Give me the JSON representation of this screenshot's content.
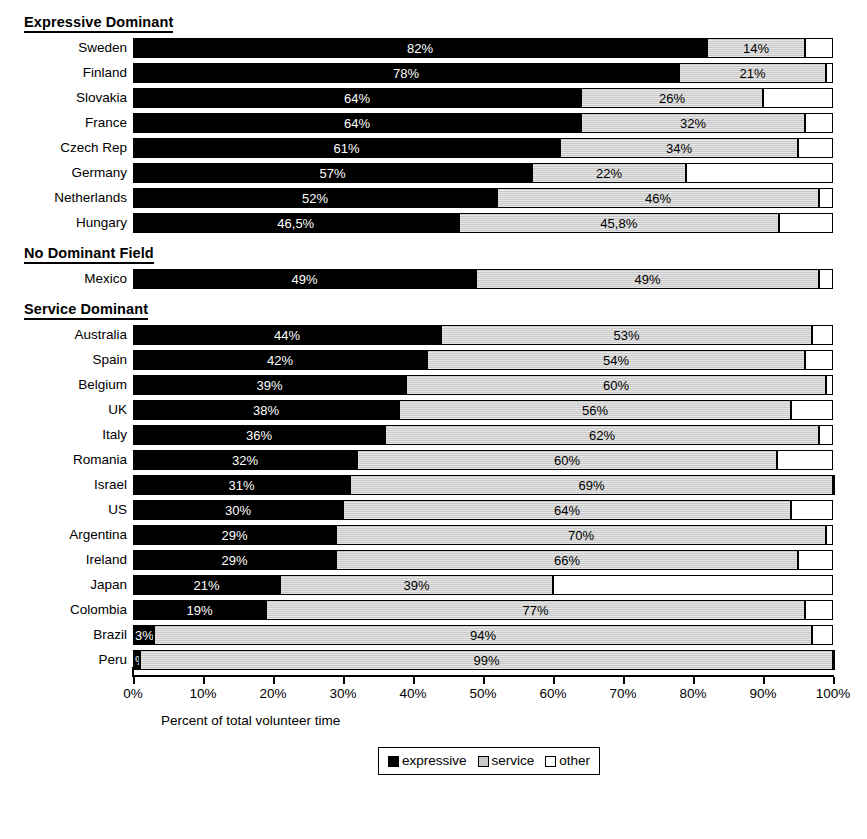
{
  "chart_data": {
    "type": "bar",
    "subtype": "stacked-horizontal-100",
    "title": "",
    "xlabel": "Percent of total volunteer time",
    "ylabel": "",
    "xlim": [
      0,
      100
    ],
    "xticks": [
      "0%",
      "10%",
      "20%",
      "30%",
      "40%",
      "50%",
      "60%",
      "70%",
      "80%",
      "90%",
      "100%"
    ],
    "grid": false,
    "legend_position": "bottom-center",
    "series": [
      {
        "name": "expressive",
        "color": "#000000"
      },
      {
        "name": "service",
        "color": "#c9c9c9"
      },
      {
        "name": "other",
        "color": "#ffffff"
      }
    ],
    "groups": [
      {
        "label": "Expressive Dominant",
        "rows": [
          {
            "category": "Sweden",
            "expressive": 82,
            "service": 14,
            "other": 4,
            "labels": {
              "expressive": "82%",
              "service": "14%",
              "other": ""
            }
          },
          {
            "category": "Finland",
            "expressive": 78,
            "service": 21,
            "other": 1,
            "labels": {
              "expressive": "78%",
              "service": "21%",
              "other": ""
            }
          },
          {
            "category": "Slovakia",
            "expressive": 64,
            "service": 26,
            "other": 10,
            "labels": {
              "expressive": "64%",
              "service": "26%",
              "other": ""
            }
          },
          {
            "category": "France",
            "expressive": 64,
            "service": 32,
            "other": 4,
            "labels": {
              "expressive": "64%",
              "service": "32%",
              "other": ""
            }
          },
          {
            "category": "Czech Rep",
            "expressive": 61,
            "service": 34,
            "other": 5,
            "labels": {
              "expressive": "61%",
              "service": "34%",
              "other": ""
            }
          },
          {
            "category": "Germany",
            "expressive": 57,
            "service": 22,
            "other": 21,
            "labels": {
              "expressive": "57%",
              "service": "22%",
              "other": ""
            }
          },
          {
            "category": "Netherlands",
            "expressive": 52,
            "service": 46,
            "other": 2,
            "labels": {
              "expressive": "52%",
              "service": "46%",
              "other": ""
            }
          },
          {
            "category": "Hungary",
            "expressive": 46.5,
            "service": 45.8,
            "other": 7.7,
            "labels": {
              "expressive": "46,5%",
              "service": "45,8%",
              "other": ""
            }
          }
        ]
      },
      {
        "label": "No Dominant Field",
        "rows": [
          {
            "category": "Mexico",
            "expressive": 49,
            "service": 49,
            "other": 2,
            "labels": {
              "expressive": "49%",
              "service": "49%",
              "other": ""
            }
          }
        ]
      },
      {
        "label": "Service Dominant",
        "rows": [
          {
            "category": "Australia",
            "expressive": 44,
            "service": 53,
            "other": 3,
            "labels": {
              "expressive": "44%",
              "service": "53%",
              "other": ""
            }
          },
          {
            "category": "Spain",
            "expressive": 42,
            "service": 54,
            "other": 4,
            "labels": {
              "expressive": "42%",
              "service": "54%",
              "other": ""
            }
          },
          {
            "category": "Belgium",
            "expressive": 39,
            "service": 60,
            "other": 1,
            "labels": {
              "expressive": "39%",
              "service": "60%",
              "other": ""
            }
          },
          {
            "category": "UK",
            "expressive": 38,
            "service": 56,
            "other": 6,
            "labels": {
              "expressive": "38%",
              "service": "56%",
              "other": ""
            }
          },
          {
            "category": "Italy",
            "expressive": 36,
            "service": 62,
            "other": 2,
            "labels": {
              "expressive": "36%",
              "service": "62%",
              "other": ""
            }
          },
          {
            "category": "Romania",
            "expressive": 32,
            "service": 60,
            "other": 8,
            "labels": {
              "expressive": "32%",
              "service": "60%",
              "other": ""
            }
          },
          {
            "category": "Israel",
            "expressive": 31,
            "service": 69,
            "other": 0,
            "labels": {
              "expressive": "31%",
              "service": "69%",
              "other": ""
            }
          },
          {
            "category": "US",
            "expressive": 30,
            "service": 64,
            "other": 6,
            "labels": {
              "expressive": "30%",
              "service": "64%",
              "other": ""
            }
          },
          {
            "category": "Argentina",
            "expressive": 29,
            "service": 70,
            "other": 1,
            "labels": {
              "expressive": "29%",
              "service": "70%",
              "other": ""
            }
          },
          {
            "category": "Ireland",
            "expressive": 29,
            "service": 66,
            "other": 5,
            "labels": {
              "expressive": "29%",
              "service": "66%",
              "other": ""
            }
          },
          {
            "category": "Japan",
            "expressive": 21,
            "service": 39,
            "other": 40,
            "labels": {
              "expressive": "21%",
              "service": "39%",
              "other": ""
            }
          },
          {
            "category": "Colombia",
            "expressive": 19,
            "service": 77,
            "other": 4,
            "labels": {
              "expressive": "19%",
              "service": "77%",
              "other": ""
            }
          },
          {
            "category": "Brazil",
            "expressive": 3,
            "service": 94,
            "other": 3,
            "labels": {
              "expressive": "3%",
              "service": "94%",
              "other": ""
            }
          },
          {
            "category": "Peru",
            "expressive": 1,
            "service": 99,
            "other": 0,
            "labels": {
              "expressive": "%",
              "service": "99%",
              "other": ""
            }
          }
        ]
      }
    ]
  }
}
